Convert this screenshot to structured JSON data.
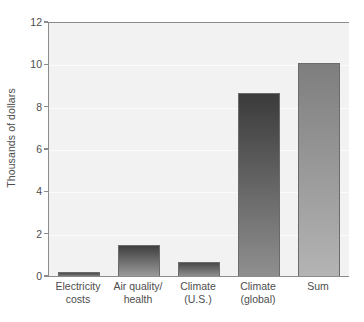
{
  "chart_data": {
    "type": "bar",
    "title": "",
    "subtitle": "",
    "xlabel": "",
    "ylabel": "Thousands of dollars",
    "categories": [
      "Electricity\ncosts",
      "Air quality/\nhealth",
      "Climate\n(U.S.)",
      "Climate\n(global)",
      "Sum"
    ],
    "values": [
      0.25,
      1.5,
      0.7,
      8.7,
      10.1
    ],
    "ylim": [
      0,
      12
    ],
    "yticks": [
      0,
      2,
      4,
      6,
      8,
      10,
      12
    ],
    "ytick_labels": [
      "0",
      "2",
      "4",
      "6",
      "8",
      "10",
      "12"
    ],
    "grid": true,
    "legend": false,
    "legend_position": "none",
    "units": "Thousands of dollars",
    "bar_colors": [
      "#606060",
      "#5a5a5a",
      "#5e5e5e",
      "#555555",
      "#8d8d8d"
    ],
    "bar_gradient_top": [
      "#4a4a4a",
      "#3f3f3f",
      "#4a4a4a",
      "#3b3b3b",
      "#7e7e7e"
    ],
    "bar_gradient_bottom": [
      "#7c7c7c",
      "#9b9b9b",
      "#8e8e8e",
      "#8f8f8f",
      "#b4b4b4"
    ],
    "plot_background": "#f2f2f2",
    "axis_color": "#8c8c8c",
    "grid_color": "#fbfbfb",
    "text_color": "#4d4d4d",
    "figure_background": "#ffffff"
  }
}
